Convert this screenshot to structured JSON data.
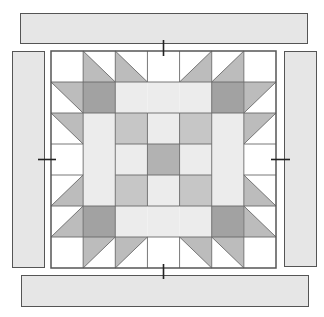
{
  "diagram": {
    "title": "",
    "colors": {
      "white": "#ffffff",
      "light": "#ececec",
      "medium": "#c6c6c6",
      "triangle": "#bcbcbc",
      "dark": "#a2a2a2",
      "center": "#b2b2b2",
      "strip": "#e6e6e6",
      "outline": "#555555",
      "grid_line": "#6a6a6a"
    },
    "grid": {
      "rows": 7,
      "cols": 7,
      "cells": [
        [
          "W",
          "T-LL",
          "T-LL",
          "W",
          "T-LR",
          "T-LR",
          "W"
        ],
        [
          "T-UR",
          "D",
          "L",
          "L",
          "L",
          "D",
          "T-UL"
        ],
        [
          "T-UR",
          "L",
          "M",
          "L",
          "M",
          "L",
          "T-UL"
        ],
        [
          "W",
          "L",
          "L",
          "C",
          "L",
          "L",
          "W"
        ],
        [
          "T-LR",
          "L",
          "M",
          "L",
          "M",
          "L",
          "T-LL"
        ],
        [
          "T-LR",
          "D",
          "L",
          "L",
          "L",
          "D",
          "T-LL"
        ],
        [
          "W",
          "T-UL",
          "T-UL",
          "W",
          "T-UR",
          "T-UR",
          "W"
        ]
      ],
      "legend": {
        "W": "white square",
        "L": "light square",
        "M": "medium square",
        "D": "dark corner square",
        "C": "center square",
        "T-LL": "half-square triangle, shaded lower-left",
        "T-LR": "half-square triangle, shaded lower-right",
        "T-UL": "half-square triangle, shaded upper-left",
        "T-UR": "half-square triangle, shaded upper-right"
      }
    },
    "border_strips": [
      {
        "name": "top-strip",
        "position": "top"
      },
      {
        "name": "bottom-strip",
        "position": "bottom"
      },
      {
        "name": "left-strip",
        "position": "left"
      },
      {
        "name": "right-strip",
        "position": "right"
      }
    ],
    "alignment_marks": [
      "top",
      "bottom",
      "left",
      "right"
    ]
  }
}
